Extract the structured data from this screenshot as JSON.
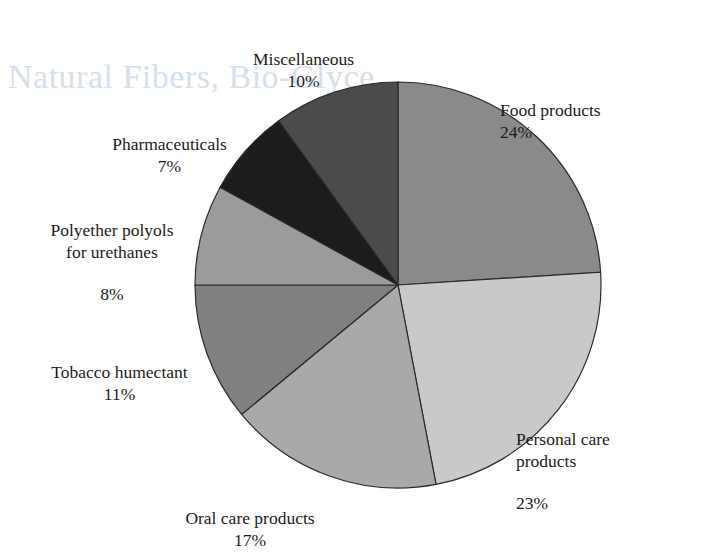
{
  "figure": {
    "watermark_text": "Natural Fibers, Bio-Glyce",
    "background_color": "#ffffff"
  },
  "chart_data": {
    "type": "pie",
    "title": "",
    "subtitle": "",
    "legend_position": "labels-outside",
    "grid": false,
    "start_angle_deg": 0,
    "direction": "clockwise",
    "center": {
      "x": 398,
      "y": 285
    },
    "radius": 203,
    "units": "percent",
    "total": 100,
    "categories": [
      "Food products",
      "Personal care products",
      "Oral care products",
      "Tobacco humectant",
      "Polyether polyols for urethanes",
      "Pharmaceuticals",
      "Miscellaneous"
    ],
    "values": [
      24,
      23,
      17,
      11,
      8,
      7,
      10
    ],
    "slices": [
      {
        "label": "Food products",
        "label_line1": "Food products",
        "value": 24,
        "percent_text": "24%",
        "color": "#8a8a8a",
        "start_deg": 0,
        "end_deg": 86.4
      },
      {
        "label": "Personal care products",
        "label_line1": "Personal care",
        "label_line2": "products",
        "value": 23,
        "percent_text": "23%",
        "color": "#c9c9c9",
        "start_deg": 86.4,
        "end_deg": 169.2
      },
      {
        "label": "Oral care products",
        "label_line1": "Oral care products",
        "value": 17,
        "percent_text": "17%",
        "color": "#a9a9a9",
        "start_deg": 169.2,
        "end_deg": 230.4
      },
      {
        "label": "Tobacco humectant",
        "label_line1": "Tobacco humectant",
        "value": 11,
        "percent_text": "11%",
        "color": "#808080",
        "start_deg": 230.4,
        "end_deg": 270.0
      },
      {
        "label": "Polyether polyols for urethanes",
        "label_line1": "Polyether polyols",
        "label_line2": "for urethanes",
        "value": 8,
        "percent_text": "8%",
        "color": "#9b9b9b",
        "start_deg": 270.0,
        "end_deg": 298.8
      },
      {
        "label": "Pharmaceuticals",
        "label_line1": "Pharmaceuticals",
        "value": 7,
        "percent_text": "7%",
        "color": "#1c1c1c",
        "start_deg": 298.8,
        "end_deg": 324.0
      },
      {
        "label": "Miscellaneous",
        "label_line1": "Miscellaneous",
        "value": 10,
        "percent_text": "10%",
        "color": "#4b4b4b",
        "start_deg": 324.0,
        "end_deg": 360.0
      }
    ],
    "stroke_color": "#2b2b2b",
    "stroke_width": 1.2
  }
}
